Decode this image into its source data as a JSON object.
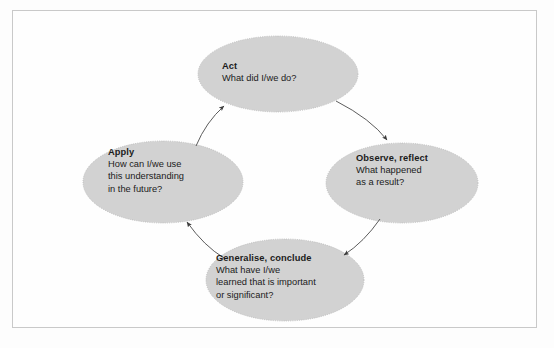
{
  "figure": {
    "type": "cycle-diagram",
    "orientation": "clockwise",
    "background_color": "#fdfdfd",
    "frame_border_color": "#c9c9c9",
    "node_fill_color": "#d2d2d2",
    "node_border_color": "#b5b5b5",
    "connector_color": "#4a4a4a",
    "text_color": "#1b1b1b"
  },
  "nodes": [
    {
      "id": "act",
      "title": "Act",
      "lines": [
        "What did I/we do?"
      ],
      "position": "top"
    },
    {
      "id": "observe",
      "title": "Observe, reflect",
      "lines": [
        "What happened",
        "as a result?"
      ],
      "position": "right"
    },
    {
      "id": "generalise",
      "title": "Generalise, conclude",
      "lines": [
        "What have I/we",
        "learned that is important",
        "or significant?"
      ],
      "position": "bottom"
    },
    {
      "id": "apply",
      "title": "Apply",
      "lines": [
        "How can I/we use",
        "this understanding",
        "in the future?"
      ],
      "position": "left"
    }
  ],
  "connectors": [
    {
      "id": "act-to-observe",
      "from": "act",
      "to": "observe"
    },
    {
      "id": "observe-to-generalise",
      "from": "observe",
      "to": "generalise"
    },
    {
      "id": "generalise-to-apply",
      "from": "generalise",
      "to": "apply"
    },
    {
      "id": "apply-to-act",
      "from": "apply",
      "to": "act"
    }
  ],
  "bleed_through": {
    "line_1": "",
    "line_2": "",
    "line_3": ""
  }
}
